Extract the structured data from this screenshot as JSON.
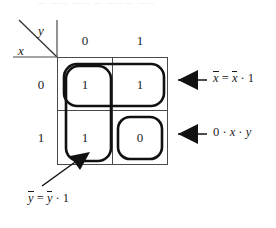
{
  "figure": {
    "name": "karnaugh-map-two-variable",
    "top_clipped_text": "— ——  ——   — ———     ——",
    "axis": {
      "var_vertical": "x",
      "var_horizontal": "y"
    },
    "column_headers": [
      "0",
      "1"
    ],
    "row_headers": [
      "0",
      "1"
    ],
    "cells": [
      {
        "name": "cell-x0-y0",
        "row": "0",
        "col": "0",
        "value": "1"
      },
      {
        "name": "cell-x0-y1",
        "row": "0",
        "col": "1",
        "value": "1"
      },
      {
        "name": "cell-x1-y0",
        "row": "1",
        "col": "0",
        "value": "1"
      },
      {
        "name": "cell-x1-y1",
        "row": "1",
        "col": "1",
        "value": "0"
      }
    ],
    "groupings": [
      {
        "name": "group-top-row",
        "shape": "rounded-rect",
        "covers": [
          "cell-x0-y0",
          "cell-x0-y1"
        ]
      },
      {
        "name": "group-left-column",
        "shape": "rounded-rect",
        "covers": [
          "cell-x0-y0",
          "cell-x1-y0"
        ]
      },
      {
        "name": "group-single-zero",
        "shape": "rounded-rect",
        "covers": [
          "cell-x1-y1"
        ]
      }
    ],
    "annotations": [
      {
        "name": "annotation-x-complement",
        "parts": {
          "lhs_var": "x",
          "eq": "=",
          "rhs_var": "x",
          "dot": "·",
          "rhs_const": "1"
        },
        "plain": "x̄ = x̄ · 1",
        "arrow": "left-arrow",
        "target": "group-top-row"
      },
      {
        "name": "annotation-zero-product",
        "parts": {
          "const": "0",
          "dot1": "·",
          "var1": "x",
          "dot2": "·",
          "var2": "y"
        },
        "plain": "0 · x · y",
        "arrow": "left-arrow",
        "target": "group-single-zero"
      },
      {
        "name": "annotation-y-complement",
        "parts": {
          "lhs_var": "y",
          "eq": "=",
          "rhs_var": "y",
          "dot": "·",
          "rhs_const": "1"
        },
        "plain": "ȳ = ȳ · 1",
        "arrow": "diagonal-up-right-arrow",
        "target": "group-left-column"
      }
    ],
    "colors": {
      "grid_line": "#4a4a4a",
      "group_outline": "#111111",
      "text": "#1a1a1a",
      "background": "#ffffff"
    }
  }
}
